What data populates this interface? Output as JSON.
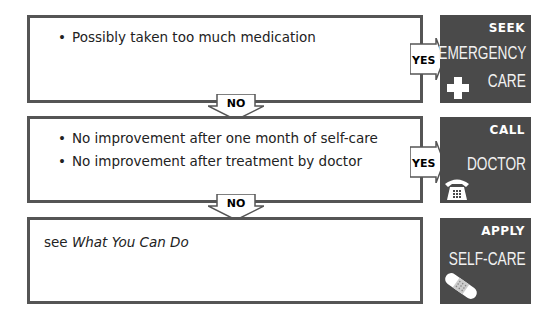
{
  "steps": [
    {
      "conditions": [
        "Possibly taken too much medication"
      ],
      "yes_label": "YES",
      "outcome": {
        "verb": "SEEK",
        "action_lines": [
          "EMERGENCY",
          "CARE"
        ],
        "icon": "medical-cross-icon"
      }
    },
    {
      "conditions": [
        "No improvement after one month of self-care",
        "No improvement after treatment by doctor"
      ],
      "yes_label": "YES",
      "outcome": {
        "verb": "CALL",
        "action_lines": [
          "DOCTOR"
        ],
        "icon": "telephone-icon"
      }
    },
    {
      "text_prefix": "see ",
      "text_italic": "What You Can Do",
      "outcome": {
        "verb": "APPLY",
        "action_lines": [
          "SELF-CARE"
        ],
        "icon": "bandage-icon"
      }
    }
  ],
  "connectors": [
    {
      "label": "NO"
    },
    {
      "label": "NO"
    }
  ],
  "colors": {
    "border": "#555555",
    "panel": "#4a4a4a",
    "panel_text": "#ffffff"
  }
}
